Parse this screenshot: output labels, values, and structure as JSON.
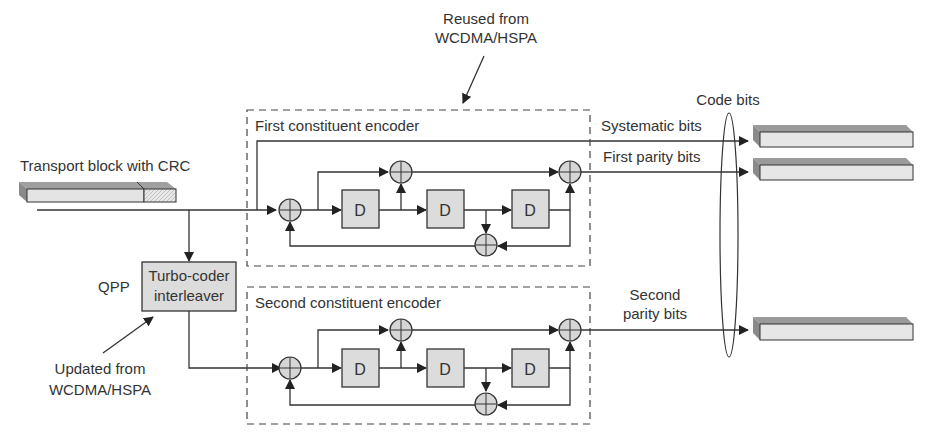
{
  "annotations": {
    "reused_line1": "Reused from",
    "reused_line2": "WCDMA/HSPA",
    "updated_line1": "Updated from",
    "updated_line2": "WCDMA/HSPA",
    "qpp": "QPP",
    "code_bits": "Code bits"
  },
  "input": {
    "label": "Transport block with CRC"
  },
  "interleaver": {
    "line1": "Turbo-coder",
    "line2": "interleaver"
  },
  "encoders": [
    {
      "title": "First constituent encoder",
      "delay_label": "D"
    },
    {
      "title": "Second constituent encoder",
      "delay_label": "D"
    }
  ],
  "outputs": {
    "systematic": "Systematic bits",
    "first_parity": "First parity bits",
    "second_parity_line1": "Second",
    "second_parity_line2": "parity bits"
  },
  "colors": {
    "line": "#333333",
    "block_fill": "#dcdcdc",
    "bar_top": "#9a9a9a",
    "bar_face": "#e6e6e6"
  }
}
